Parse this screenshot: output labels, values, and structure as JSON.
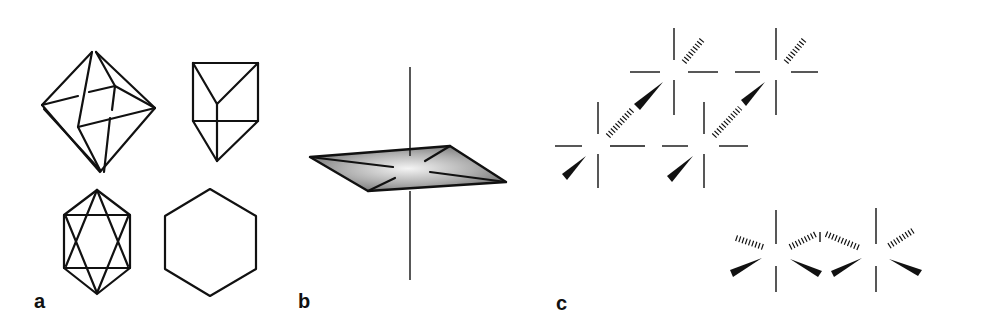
{
  "figure": {
    "panels": [
      {
        "label": "a",
        "description": "Coordination polyhedra: octahedron, trigonal prism, hexagonal-bipyramid projection, hexagon"
      },
      {
        "label": "b",
        "description": "Octahedral ML6 complex with shaded equatorial plane",
        "center_atom": "M",
        "ligand": "L"
      },
      {
        "label": "c",
        "description": "Tetrameric (MoF5)4 and dimeric [Mn(CO)4I]2 bridged structures"
      }
    ],
    "panel_b": {
      "center": "M",
      "ligands": [
        "L",
        "L",
        "L",
        "L",
        "L",
        "L"
      ]
    },
    "panel_c": {
      "mo_tetramer": {
        "metal": "Mo",
        "ligand": "F",
        "metal_count": 4
      },
      "mn_dimer": {
        "metal": "Mn",
        "bridging": "I",
        "terminal": "CO",
        "terminal_left": "OC"
      }
    }
  }
}
